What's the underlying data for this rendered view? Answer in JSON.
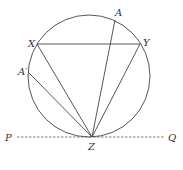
{
  "diagram": {
    "type": "circle-geometry",
    "circle": {
      "cx": 89,
      "cy": 76,
      "r": 61
    },
    "points": {
      "X": {
        "label": "X",
        "x": 37,
        "y": 44
      },
      "Y": {
        "label": "Y",
        "x": 140,
        "y": 44
      },
      "A": {
        "label": "A",
        "x": 115,
        "y": 20
      },
      "A_prime": {
        "label": "A′",
        "x": 29,
        "y": 73
      },
      "Z": {
        "label": "Z",
        "x": 92,
        "y": 137
      },
      "P": {
        "label": "P"
      },
      "Q": {
        "label": "Q"
      }
    },
    "segments": [
      "XY",
      "XZ",
      "YZ",
      "AZ",
      "A'Z"
    ],
    "tangent_line": {
      "from": "P",
      "to": "Q",
      "through": "Z",
      "style": "dashed"
    }
  }
}
